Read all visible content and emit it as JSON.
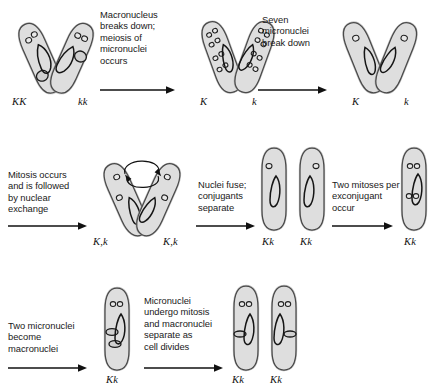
{
  "figure": {
    "background_color": "#ffffff",
    "cell_fill_color": "#dedede",
    "cell_outline_color": "#4a4a4a",
    "nucleus_outline_color": "#1b1b1b",
    "text_color": "#1a1a1a"
  },
  "rows": [
    {
      "id": "row-1",
      "steps": [
        {
          "id": "step-1",
          "stage": "conjugating-pair-initial",
          "arrangement": "v-pair",
          "labels": [
            "KK",
            "kk"
          ],
          "micronuclei_per_cell": 2,
          "macronuclei_per_cell": 1
        },
        {
          "id": "arrow-1",
          "type": "arrow",
          "caption": "Macronucleus\nbreaks down;\nmeiosis of\nmicronuclei\noccurs"
        },
        {
          "id": "step-2",
          "stage": "meiosis-eight-micronuclei",
          "arrangement": "v-pair",
          "labels": [
            "K",
            "k"
          ],
          "micronuclei_per_cell": 8,
          "macronuclei_per_cell": 0
        },
        {
          "id": "arrow-2",
          "type": "arrow",
          "caption": "Seven\nmicronuclei\nbreak down"
        },
        {
          "id": "step-3",
          "stage": "single-micronucleus-pair",
          "arrangement": "v-pair",
          "labels": [
            "K",
            "k"
          ],
          "micronuclei_per_cell": 1,
          "macronuclei_per_cell": 0
        }
      ]
    },
    {
      "id": "row-2",
      "steps": [
        {
          "id": "arrow-3",
          "type": "arrow",
          "caption": "Mitosis occurs\nand is followed\nby nuclear\nexchange"
        },
        {
          "id": "step-4",
          "stage": "nuclear-exchange",
          "arrangement": "v-pair",
          "labels": [
            "K,k",
            "K,k"
          ],
          "micronuclei_per_cell": 2,
          "macronuclei_per_cell": 0,
          "has_exchange_arrows": true
        },
        {
          "id": "arrow-4",
          "type": "arrow",
          "caption": "Nuclei fuse;\nconjugants\nseparate"
        },
        {
          "id": "step-5",
          "stage": "separated-exconjugants",
          "arrangement": "upright-pair",
          "labels": [
            "Kk",
            "Kk"
          ],
          "micronuclei_per_cell": 1,
          "macronuclei_per_cell": 0
        },
        {
          "id": "arrow-5",
          "type": "arrow",
          "caption": "Two mitoses per\nexconjugant\noccur"
        },
        {
          "id": "step-6",
          "stage": "four-micronuclei",
          "arrangement": "upright-single",
          "labels": [
            "Kk"
          ],
          "micronuclei_per_cell": 4,
          "macronuclei_per_cell": 0
        }
      ]
    },
    {
      "id": "row-3",
      "steps": [
        {
          "id": "arrow-6",
          "type": "arrow",
          "caption": "Two micronuclei\nbecome\nmacronuclei"
        },
        {
          "id": "step-7",
          "stage": "two-macronuclei-formed",
          "arrangement": "upright-single",
          "labels": [
            "Kk"
          ],
          "micronuclei_per_cell": 2,
          "macronuclei_per_cell": 2
        },
        {
          "id": "arrow-7",
          "type": "arrow",
          "caption": "Micronuclei\nundergo mitosis\nand macronuclei\nseparate as\ncell divides"
        },
        {
          "id": "step-8",
          "stage": "daughter-cells",
          "arrangement": "upright-pair",
          "labels": [
            "Kk",
            "Kk"
          ],
          "micronuclei_per_cell": 2,
          "macronuclei_per_cell": 1
        }
      ]
    }
  ]
}
